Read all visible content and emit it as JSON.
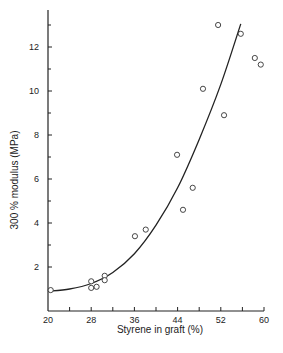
{
  "chart_data": {
    "type": "scatter",
    "title": "",
    "xlabel": "Styrene in graft (%)",
    "ylabel": "300 % modulus (MPa)",
    "xlim": [
      20,
      60
    ],
    "ylim": [
      0,
      13.5
    ],
    "xticks": [
      20,
      28,
      36,
      44,
      52,
      60
    ],
    "yticks": [
      2,
      4,
      6,
      8,
      10,
      12
    ],
    "grid": false,
    "legend": null,
    "series": [
      {
        "name": "data",
        "marker": "open-circle",
        "points": [
          [
            20.5,
            0.95
          ],
          [
            28.0,
            1.35
          ],
          [
            28.0,
            1.05
          ],
          [
            29.0,
            1.1
          ],
          [
            30.5,
            1.6
          ],
          [
            30.5,
            1.4
          ],
          [
            36.1,
            3.4
          ],
          [
            38.1,
            3.7
          ],
          [
            43.9,
            7.1
          ],
          [
            45.0,
            4.6
          ],
          [
            46.8,
            5.6
          ],
          [
            48.7,
            10.1
          ],
          [
            51.5,
            13.0
          ],
          [
            52.6,
            8.9
          ],
          [
            55.7,
            12.6
          ],
          [
            58.3,
            11.5
          ],
          [
            59.4,
            11.2
          ]
        ]
      },
      {
        "name": "fit",
        "style": "line",
        "points": [
          [
            20,
            0.9
          ],
          [
            24,
            1.0
          ],
          [
            28,
            1.25
          ],
          [
            32,
            1.75
          ],
          [
            36,
            2.6
          ],
          [
            40,
            3.9
          ],
          [
            44,
            5.6
          ],
          [
            48,
            7.8
          ],
          [
            52,
            10.3
          ],
          [
            55.7,
            13.05
          ]
        ]
      }
    ]
  }
}
